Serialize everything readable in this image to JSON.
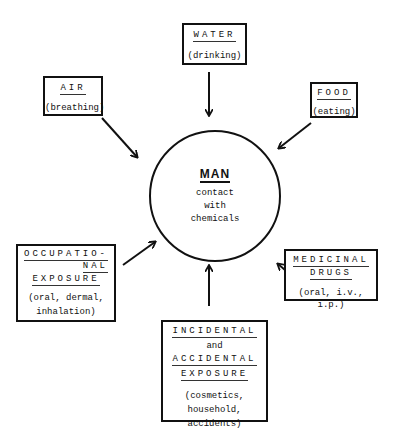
{
  "center": {
    "title": "MAN",
    "lines": [
      "contact",
      "with",
      "chemicals"
    ]
  },
  "sources": {
    "water": {
      "title": "WATER",
      "detail": "(drinking)"
    },
    "air": {
      "title": "AIR",
      "detail": "(breathing)"
    },
    "food": {
      "title": "FOOD",
      "detail": "(eating)"
    },
    "occupational": {
      "title_lines": [
        "OCCUPATIO-",
        "NAL",
        "EXPOSURE"
      ],
      "detail_lines": [
        "(oral, dermal,",
        "inhalation)"
      ]
    },
    "medicinal": {
      "title_lines": [
        "MEDICINAL",
        "DRUGS"
      ],
      "detail": "(oral, i.v., i.p.)"
    },
    "incidental": {
      "title_lines": [
        "INCIDENTAL"
      ],
      "connector": "and",
      "title_lines_2": [
        "ACCIDENTAL",
        "EXPOSURE"
      ],
      "detail_lines": [
        "(cosmetics,",
        "household,",
        "accidents)"
      ]
    }
  }
}
